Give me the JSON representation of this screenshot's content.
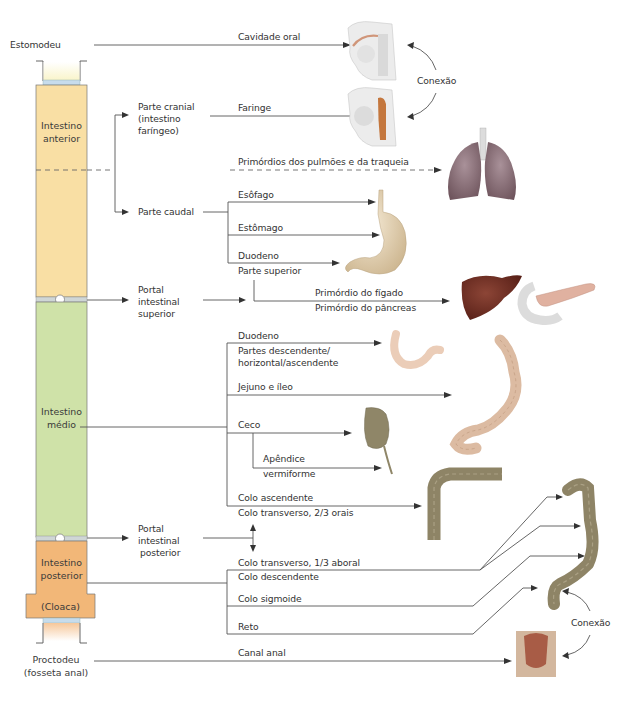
{
  "diagram": {
    "colors": {
      "foregut": "#f9dfa4",
      "midgut": "#cfe2a8",
      "hindgut": "#f2b778",
      "membrane": "#c7dcec",
      "line": "#555555",
      "stomach": "#e8d6b6",
      "liver": "#6e2f24",
      "lungs": "#8a7078",
      "colon": "#9a8c6c"
    },
    "column": {
      "stomodeum": "Estomodeu",
      "foregut": [
        "Intestino",
        "anterior"
      ],
      "midgut": [
        "Intestino",
        "médio"
      ],
      "hindgut": [
        "Intestino",
        "posterior"
      ],
      "cloaca": "(Cloaca)",
      "proctodeum": [
        "Proctodeu",
        "(fosseta anal)"
      ]
    },
    "branches": {
      "cranial": [
        "Parte cranial",
        "(intestino",
        "faríngeo)"
      ],
      "caudal": "Parte caudal",
      "portal_superior": [
        "Portal",
        "intestinal",
        "superior"
      ],
      "portal_posterior": [
        "Portal",
        "intestinal",
        "posterior"
      ]
    },
    "derivatives": {
      "oral_cavity": "Cavidade oral",
      "pharynx": "Faringe",
      "lung_primordia": "Primórdios dos pulmões e da traqueia",
      "esophagus": "Esôfago",
      "stomach": "Estômago",
      "duodenum_upper": [
        "Duodeno",
        "Parte superior"
      ],
      "liver_primordium": "Primórdio do fígado",
      "pancreas_primordium": "Primórdio do pâncreas",
      "duodenum_lower": [
        "Duodeno",
        "Partes descendente/",
        "horizontal/ascendente"
      ],
      "jejunum_ileum": "Jejuno e íleo",
      "cecum": "Ceco",
      "appendix": [
        "Apêndice",
        "vermiforme"
      ],
      "ascending_colon": "Colo ascendente",
      "transverse_oral": "Colo transverso, 2/3 orais",
      "transverse_aboral": "Colo transverso, 1/3 aboral",
      "descending_colon": "Colo descendente",
      "sigmoid_colon": "Colo sigmoide",
      "rectum": "Reto",
      "anal_canal": "Canal anal"
    },
    "connections": {
      "top": "Conexão",
      "bottom": "Conexão"
    },
    "illustrations": [
      "oral-cavity-illustration",
      "pharynx-illustration",
      "lungs-illustration",
      "stomach-illustration",
      "liver-illustration",
      "pancreas-illustration",
      "duodenum-illustration",
      "small-intestine-illustration",
      "cecum-illustration",
      "colon-ascending-transverse-illustration",
      "colon-descending-sigmoid-illustration",
      "anal-canal-illustration"
    ]
  }
}
